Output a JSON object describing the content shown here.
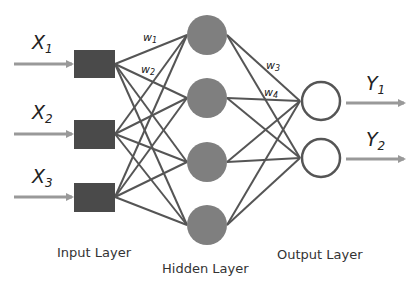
{
  "diagram": {
    "type": "neural-network",
    "colors": {
      "input_node": "#4a4a4a",
      "hidden_node": "#7f7f7f",
      "output_node_stroke": "#555555",
      "edge": "#555555",
      "arrow": "#999999"
    },
    "inputs": [
      {
        "var": "X",
        "sub": "1"
      },
      {
        "var": "X",
        "sub": "2"
      },
      {
        "var": "X",
        "sub": "3"
      }
    ],
    "outputs": [
      {
        "var": "Y",
        "sub": "1"
      },
      {
        "var": "Y",
        "sub": "2"
      }
    ],
    "weights": [
      {
        "var": "w",
        "sub": "1"
      },
      {
        "var": "w",
        "sub": "2"
      },
      {
        "var": "w",
        "sub": "3"
      },
      {
        "var": "w",
        "sub": "4"
      }
    ],
    "layers": {
      "input": "Input Layer",
      "hidden": "Hidden Layer",
      "output": "Output Layer"
    },
    "node_counts": {
      "input": 3,
      "hidden": 4,
      "output": 2
    }
  }
}
